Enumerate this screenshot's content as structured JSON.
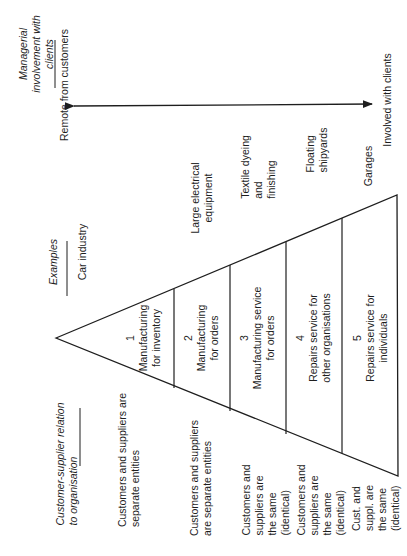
{
  "diagram": {
    "orientation": "rotated 90 degrees counter-clockwise (text reads bottom-to-top)",
    "managerial_axis": {
      "heading_lines": [
        "Managerial",
        "involvement with",
        "clients"
      ],
      "remote_label": "Remote from customers",
      "involved_label": "Involved with clients"
    },
    "examples": {
      "heading": "Examples",
      "items": [
        {
          "lines": [
            "Car industry"
          ]
        },
        {
          "lines": [
            "Large electrical",
            "equipment"
          ]
        },
        {
          "lines": [
            "Textile dyeing",
            "and",
            "finishing"
          ]
        },
        {
          "lines": [
            "Floating",
            "shipyards"
          ]
        },
        {
          "lines": [
            "Garages"
          ]
        }
      ]
    },
    "triangle_sections": [
      {
        "number": "1",
        "lines": [
          "Manufacturing",
          "for inventory"
        ]
      },
      {
        "number": "2",
        "lines": [
          "Manufacturing",
          "for orders"
        ]
      },
      {
        "number": "3",
        "lines": [
          "Manufacturing service",
          "for orders"
        ]
      },
      {
        "number": "4",
        "lines": [
          "Repairs service for",
          "other organisations"
        ]
      },
      {
        "number": "5",
        "lines": [
          "Repairs service for",
          "individuals"
        ]
      }
    ],
    "relation": {
      "heading_lines": [
        "Customer-supplier relation",
        "to organisation"
      ],
      "items": [
        {
          "lines": [
            "Customers and suppliers are",
            "separate entities"
          ]
        },
        {
          "lines": [
            "Customers and suppliers",
            "are separate entities"
          ]
        },
        {
          "lines": [
            "Customers and",
            "suppliers are",
            "the same",
            "(identical)"
          ]
        },
        {
          "lines": [
            "Customers and",
            "suppliers are",
            "the same",
            "(identical)"
          ]
        },
        {
          "lines": [
            "Cust. and",
            "suppl. are",
            "the same",
            "(identical)"
          ]
        }
      ]
    },
    "line_color": "#1e1e1e"
  }
}
